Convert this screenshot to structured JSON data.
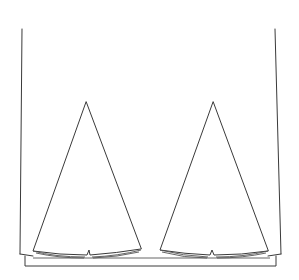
{
  "diagram": {
    "type": "line-drawing",
    "colors": {
      "background": "#ffffff",
      "stroke": "#3a3a3a"
    },
    "elements": [
      {
        "id": "container",
        "label": "open container with left and right walls"
      },
      {
        "id": "base-plate",
        "label": "base plate / tray"
      },
      {
        "id": "cone-left",
        "label": "left cone"
      },
      {
        "id": "cone-right",
        "label": "right cone"
      }
    ]
  }
}
